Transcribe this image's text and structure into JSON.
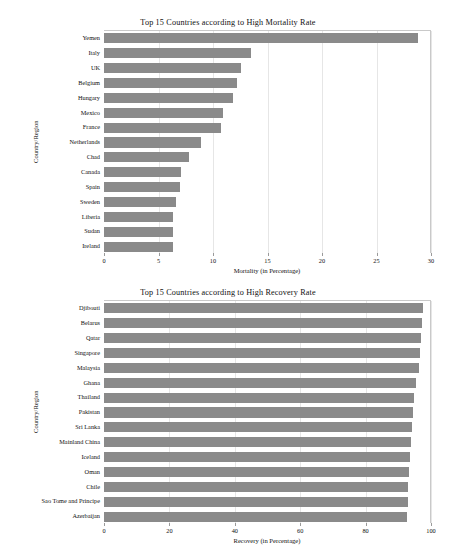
{
  "figure": {
    "background": "#ffffff",
    "bar_color": "#8a8a8a",
    "grid_color": "#e6e6e6"
  },
  "charts": [
    {
      "id": "mortality",
      "title": "Top 15 Countries according to High Mortality Rate",
      "xlabel": "Mortality (in Percentage)",
      "ylabel": "Country/Region",
      "xticks": [
        "0",
        "5",
        "10",
        "15",
        "20",
        "25",
        "30"
      ]
    },
    {
      "id": "recovery",
      "title": "Top 15 Countries according to High Recovery Rate",
      "xlabel": "Recovery (in Percentage)",
      "ylabel": "Country/Region",
      "xticks": [
        "0",
        "20",
        "40",
        "60",
        "80",
        "100"
      ]
    }
  ],
  "chart_data": [
    {
      "type": "bar",
      "orientation": "horizontal",
      "title": "Top 15 Countries according to High Mortality Rate",
      "xlabel": "Mortality (in Percentage)",
      "ylabel": "Country/Region",
      "xlim": [
        0,
        30
      ],
      "xticks": [
        0,
        5,
        10,
        15,
        20,
        25,
        30
      ],
      "grid": "vertical",
      "legend": "none",
      "categories": [
        "Yemen",
        "Italy",
        "UK",
        "Belgium",
        "Hungary",
        "Mexico",
        "France",
        "Netherlands",
        "Chad",
        "Canada",
        "Spain",
        "Sweden",
        "Liberia",
        "Sudan",
        "Ireland"
      ],
      "values": [
        28.8,
        13.5,
        12.6,
        12.2,
        11.8,
        10.9,
        10.7,
        8.9,
        7.8,
        7.1,
        7.0,
        6.6,
        6.3,
        6.3,
        6.3
      ]
    },
    {
      "type": "bar",
      "orientation": "horizontal",
      "title": "Top 15 Countries according to High Recovery Rate",
      "xlabel": "Recovery (in Percentage)",
      "ylabel": "Country/Region",
      "xlim": [
        0,
        100
      ],
      "xticks": [
        0,
        20,
        40,
        60,
        80,
        100
      ],
      "grid": "vertical",
      "legend": "none",
      "categories": [
        "Djibouti",
        "Belarus",
        "Qatar",
        "Singapore",
        "Malaysia",
        "Ghana",
        "Thailand",
        "Pakistan",
        "Sri Lanka",
        "Mainland China",
        "Iceland",
        "Oman",
        "Chile",
        "Sao Tome and Principe",
        "Azerbaijan"
      ],
      "values": [
        97.6,
        97.3,
        97.0,
        96.7,
        96.2,
        95.3,
        94.7,
        94.4,
        94.3,
        93.8,
        93.7,
        93.2,
        93.0,
        92.9,
        92.8
      ]
    }
  ]
}
